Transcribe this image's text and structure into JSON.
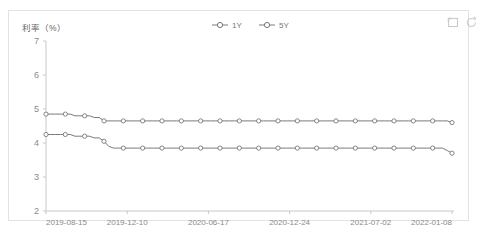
{
  "chart_data": {
    "type": "line",
    "title": "",
    "ylabel": "利率（%）",
    "xlabel": "",
    "ylim": [
      2,
      7
    ],
    "yticks": [
      2,
      3,
      4,
      5,
      6,
      7
    ],
    "grid": false,
    "legend_position": "top-center",
    "xtick_labels": [
      "2019-08-15",
      "2019-12-10",
      "2020-06-17",
      "2020-12-24",
      "2021-07-02",
      "2022-01-08"
    ],
    "markers": "circle",
    "series": [
      {
        "name": "1Y",
        "color": "#6b6b6b",
        "values": [
          4.85,
          4.85,
          4.85,
          4.85,
          4.85,
          4.85,
          4.8,
          4.8,
          4.8,
          4.8,
          4.75,
          4.75,
          4.65,
          4.65,
          4.65,
          4.65,
          4.65,
          4.65,
          4.65,
          4.65,
          4.65,
          4.65,
          4.65,
          4.65,
          4.65,
          4.65,
          4.65,
          4.65,
          4.65,
          4.65,
          4.65,
          4.65,
          4.65,
          4.65,
          4.65,
          4.65,
          4.65,
          4.65,
          4.65,
          4.65,
          4.65,
          4.65,
          4.65,
          4.65,
          4.65,
          4.65,
          4.65,
          4.65,
          4.65,
          4.65,
          4.65,
          4.65,
          4.65,
          4.65,
          4.65,
          4.65,
          4.65,
          4.65,
          4.65,
          4.65,
          4.65,
          4.65,
          4.65,
          4.65,
          4.65,
          4.65,
          4.65,
          4.65,
          4.65,
          4.65,
          4.65,
          4.65,
          4.65,
          4.65,
          4.65,
          4.65,
          4.65,
          4.65,
          4.65,
          4.65,
          4.65,
          4.65,
          4.65,
          4.65,
          4.6
        ]
      },
      {
        "name": "5Y",
        "color": "#6b6b6b",
        "values": [
          4.25,
          4.25,
          4.25,
          4.25,
          4.25,
          4.25,
          4.2,
          4.2,
          4.2,
          4.2,
          4.15,
          4.15,
          4.05,
          3.9,
          3.85,
          3.85,
          3.85,
          3.85,
          3.85,
          3.85,
          3.85,
          3.85,
          3.85,
          3.85,
          3.85,
          3.85,
          3.85,
          3.85,
          3.85,
          3.85,
          3.85,
          3.85,
          3.85,
          3.85,
          3.85,
          3.85,
          3.85,
          3.85,
          3.85,
          3.85,
          3.85,
          3.85,
          3.85,
          3.85,
          3.85,
          3.85,
          3.85,
          3.85,
          3.85,
          3.85,
          3.85,
          3.85,
          3.85,
          3.85,
          3.85,
          3.85,
          3.85,
          3.85,
          3.85,
          3.85,
          3.85,
          3.85,
          3.85,
          3.85,
          3.85,
          3.85,
          3.85,
          3.85,
          3.85,
          3.85,
          3.85,
          3.85,
          3.85,
          3.85,
          3.85,
          3.85,
          3.85,
          3.85,
          3.85,
          3.85,
          3.85,
          3.85,
          3.85,
          3.78,
          3.7
        ]
      }
    ]
  },
  "toolbox": {
    "datazoom_label": "区域缩放",
    "restore_label": "还原"
  }
}
